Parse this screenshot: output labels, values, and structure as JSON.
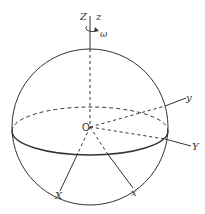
{
  "figure": {
    "labels": {
      "Z": "Z",
      "z": "z",
      "omega": "ω",
      "origin": "O",
      "y": "y",
      "Y": "Y",
      "X": "X",
      "x": "x"
    },
    "colors": {
      "stroke": "#333333",
      "background": "#ffffff"
    }
  }
}
